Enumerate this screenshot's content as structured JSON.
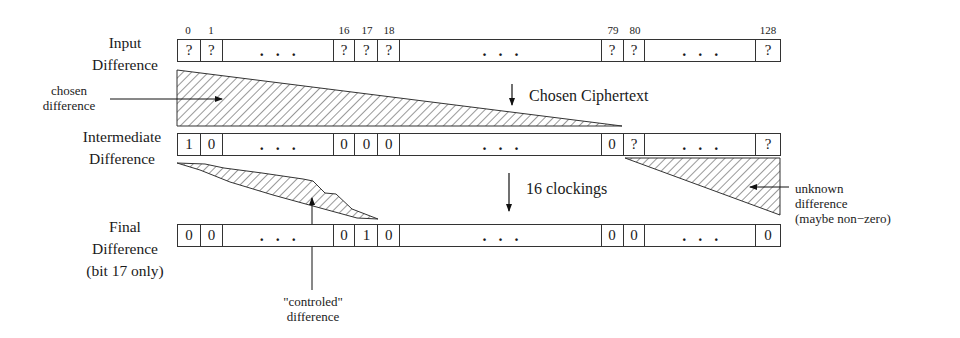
{
  "rows": [
    {
      "label_lines": [
        "Input",
        "Difference"
      ],
      "cells": [
        "?",
        "?",
        "...",
        "?",
        "?",
        "?",
        "...",
        "?",
        "?",
        "...",
        "?"
      ]
    },
    {
      "label_lines": [
        "Intermediate",
        "Difference"
      ],
      "cells": [
        "1",
        "0",
        "...",
        "0",
        "0",
        "0",
        "...",
        "0",
        "?",
        "...",
        "?"
      ]
    },
    {
      "label_lines": [
        "Final",
        "Difference",
        "(bit 17 only)"
      ],
      "cells": [
        "0",
        "0",
        "...",
        "0",
        "1",
        "0",
        "...",
        "0",
        "0",
        "...",
        "0"
      ]
    }
  ],
  "bit_indices": [
    "0",
    "1",
    "16",
    "17",
    "18",
    "79",
    "80",
    "128"
  ],
  "steps": {
    "chosen_ciphertext": "Chosen Ciphertext",
    "clockings": "16 clockings"
  },
  "annotations": {
    "chosen_difference": [
      "chosen",
      "difference"
    ],
    "unknown_difference": [
      "unknown",
      "difference",
      "(maybe non−zero)"
    ],
    "controlled_difference": [
      "\"controled\"",
      "difference"
    ]
  }
}
